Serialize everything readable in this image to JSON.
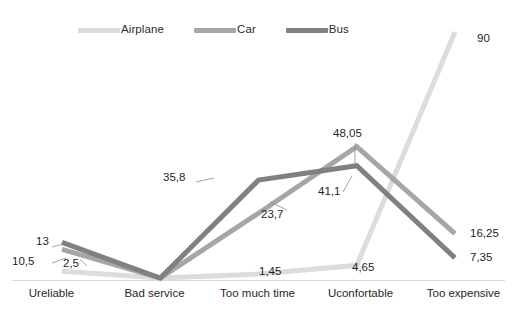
{
  "chart_data": {
    "type": "line",
    "title": "",
    "subtitle": "",
    "xlabel": "",
    "ylabel": "",
    "categories": [
      "Ureliable",
      "Bad service",
      "Too much time",
      "Uconfortable",
      "Too expensive"
    ],
    "ylim": [
      0,
      90
    ],
    "grid": false,
    "legend_position": "top-left",
    "decimal_separator": ",",
    "series": [
      {
        "name": "Airplane",
        "color": "#dcdcdc",
        "values": [
          2.5,
          0,
          1.45,
          4.65,
          90
        ],
        "labels": [
          "2,5",
          "",
          "1,45",
          "4,65",
          "90"
        ]
      },
      {
        "name": "Car",
        "color": "#a6a6a6",
        "values": [
          10.5,
          0,
          23.7,
          48.05,
          16.25
        ],
        "labels": [
          "10,5",
          "",
          "23,7",
          "48,05",
          "16,25"
        ]
      },
      {
        "name": "Bus",
        "color": "#808080",
        "values": [
          13,
          0,
          35.8,
          41.1,
          7.35
        ],
        "labels": [
          "13",
          "",
          "35,8",
          "41,1",
          "7,35"
        ]
      }
    ]
  },
  "legend": {
    "items": [
      {
        "label": "Airplane"
      },
      {
        "label": "Car"
      },
      {
        "label": "Bus"
      }
    ]
  },
  "axis": {
    "baseline_color": "#d9d9d9"
  },
  "labels": {
    "bus_ureliable": "13",
    "car_ureliable": "10,5",
    "airplane_ureliable": "2,5",
    "bus_toomuchtime": "35,8",
    "car_toomuchtime": "23,7",
    "airplane_toomuchtime": "1,45",
    "car_uconfortable": "48,05",
    "bus_uconfortable": "41,1",
    "airplane_uconfortable": "4,65",
    "airplane_tooexpensive": "90",
    "car_tooexpensive": "16,25",
    "bus_tooexpensive": "7,35"
  }
}
